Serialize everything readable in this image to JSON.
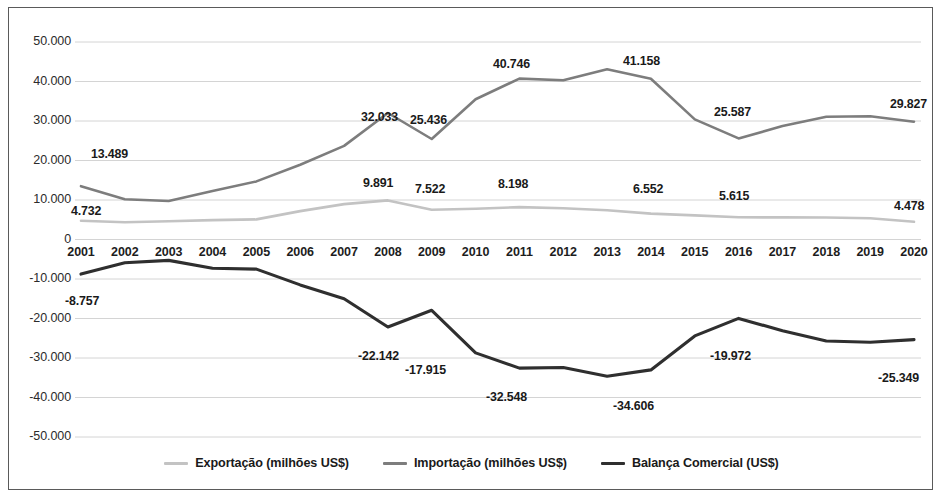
{
  "chart_data": {
    "type": "line",
    "title": "",
    "subtitle": "",
    "xlabel": "",
    "ylabel": "",
    "grid": true,
    "legend_position": "bottom",
    "ylim": [
      -50000,
      50000
    ],
    "ytick_labels": [
      "50.000",
      "40.000",
      "30.000",
      "20.000",
      "10.000",
      "0",
      "-10.000",
      "-20.000",
      "-30.000",
      "-40.000",
      "-50.000"
    ],
    "ytick_values": [
      50000,
      40000,
      30000,
      20000,
      10000,
      0,
      -10000,
      -20000,
      -30000,
      -40000,
      -50000
    ],
    "categories": [
      "2001",
      "2002",
      "2003",
      "2004",
      "2005",
      "2006",
      "2007",
      "2008",
      "2009",
      "2010",
      "2011",
      "2012",
      "2013",
      "2014",
      "2015",
      "2016",
      "2017",
      "2018",
      "2019",
      "2020"
    ],
    "series": [
      {
        "name": "Exportação (milhões US$)",
        "color": "#c3c3c3",
        "values": [
          4732,
          4390,
          4620,
          4900,
          5100,
          7200,
          8950,
          9891,
          7522,
          7800,
          8198,
          7900,
          7400,
          6552,
          6100,
          5615,
          5600,
          5560,
          5400,
          4478
        ]
      },
      {
        "name": "Importação (milhões US$)",
        "color": "#7d7d7d",
        "values": [
          13489,
          10200,
          9750,
          12300,
          14700,
          18900,
          23700,
          32033,
          25436,
          35500,
          40746,
          40300,
          43100,
          40700,
          30400,
          25587,
          28700,
          31100,
          31200,
          29827
        ]
      },
      {
        "name": "Balança Comercial (US$)",
        "color": "#2f2f2f",
        "values": [
          -8757,
          -5900,
          -5300,
          -7300,
          -7500,
          -11500,
          -15000,
          -22142,
          -17915,
          -28700,
          -32548,
          -32400,
          -34606,
          -33000,
          -24400,
          -19972,
          -23100,
          -25700,
          -26000,
          -25349
        ]
      }
    ],
    "data_labels": [
      {
        "text": "13.489",
        "x": 90,
        "y": 146,
        "series": "Importação (milhões US$)"
      },
      {
        "text": "4.732",
        "x": 70,
        "y": 203,
        "series": "Exportação (milhões US$)"
      },
      {
        "text": "-8.757",
        "x": 64,
        "y": 293,
        "series": "Balança Comercial (US$)"
      },
      {
        "text": "32.033",
        "x": 360,
        "y": 109,
        "series": "Importação (milhões US$)"
      },
      {
        "text": "9.891",
        "x": 362,
        "y": 175,
        "series": "Exportação (milhões US$)"
      },
      {
        "text": "-22.142",
        "x": 357,
        "y": 348,
        "series": "Balança Comercial (US$)"
      },
      {
        "text": "25.436",
        "x": 409,
        "y": 112,
        "series": "Importação (milhões US$)"
      },
      {
        "text": "7.522",
        "x": 414,
        "y": 181,
        "series": "Exportação (milhões US$)"
      },
      {
        "text": "-17.915",
        "x": 404,
        "y": 362,
        "series": "Balança Comercial (US$)"
      },
      {
        "text": "40.746",
        "x": 492,
        "y": 56,
        "series": "Importação (milhões US$)"
      },
      {
        "text": "8.198",
        "x": 497,
        "y": 176,
        "series": "Exportação (milhões US$)"
      },
      {
        "text": "-32.548",
        "x": 485,
        "y": 389,
        "series": "Balança Comercial (US$)"
      },
      {
        "text": "41.158",
        "x": 622,
        "y": 53,
        "series": "Importação (milhões US$)"
      },
      {
        "text": "6.552",
        "x": 632,
        "y": 181,
        "series": "Exportação (milhões US$)"
      },
      {
        "text": "-34.606",
        "x": 612,
        "y": 398,
        "series": "Balança Comercial (US$)"
      },
      {
        "text": "25.587",
        "x": 713,
        "y": 104,
        "series": "Importação (milhões US$)"
      },
      {
        "text": "5.615",
        "x": 718,
        "y": 188,
        "series": "Exportação (milhões US$)"
      },
      {
        "text": "-19.972",
        "x": 709,
        "y": 348,
        "series": "Balança Comercial (US$)"
      },
      {
        "text": "29.827",
        "x": 889,
        "y": 96,
        "series": "Importação (milhões US$)"
      },
      {
        "text": "4.478",
        "x": 893,
        "y": 198,
        "series": "Exportação (milhões US$)"
      },
      {
        "text": "-25.349",
        "x": 877,
        "y": 370,
        "series": "Balança Comercial (US$)"
      }
    ]
  },
  "legend": {
    "items": [
      {
        "label": "Exportação (milhões US$)",
        "color": "#c3c3c3"
      },
      {
        "label": "Importação (milhões US$)",
        "color": "#7d7d7d"
      },
      {
        "label": "Balança Comercial (US$)",
        "color": "#2f2f2f"
      }
    ]
  },
  "colors": {
    "export_line": "#c3c3c3",
    "import_line": "#7d7d7d",
    "balance_line": "#2f2f2f",
    "gridline": "#d4d4d4",
    "frame": "#5a5a5a",
    "text": "#1a1a1a"
  }
}
